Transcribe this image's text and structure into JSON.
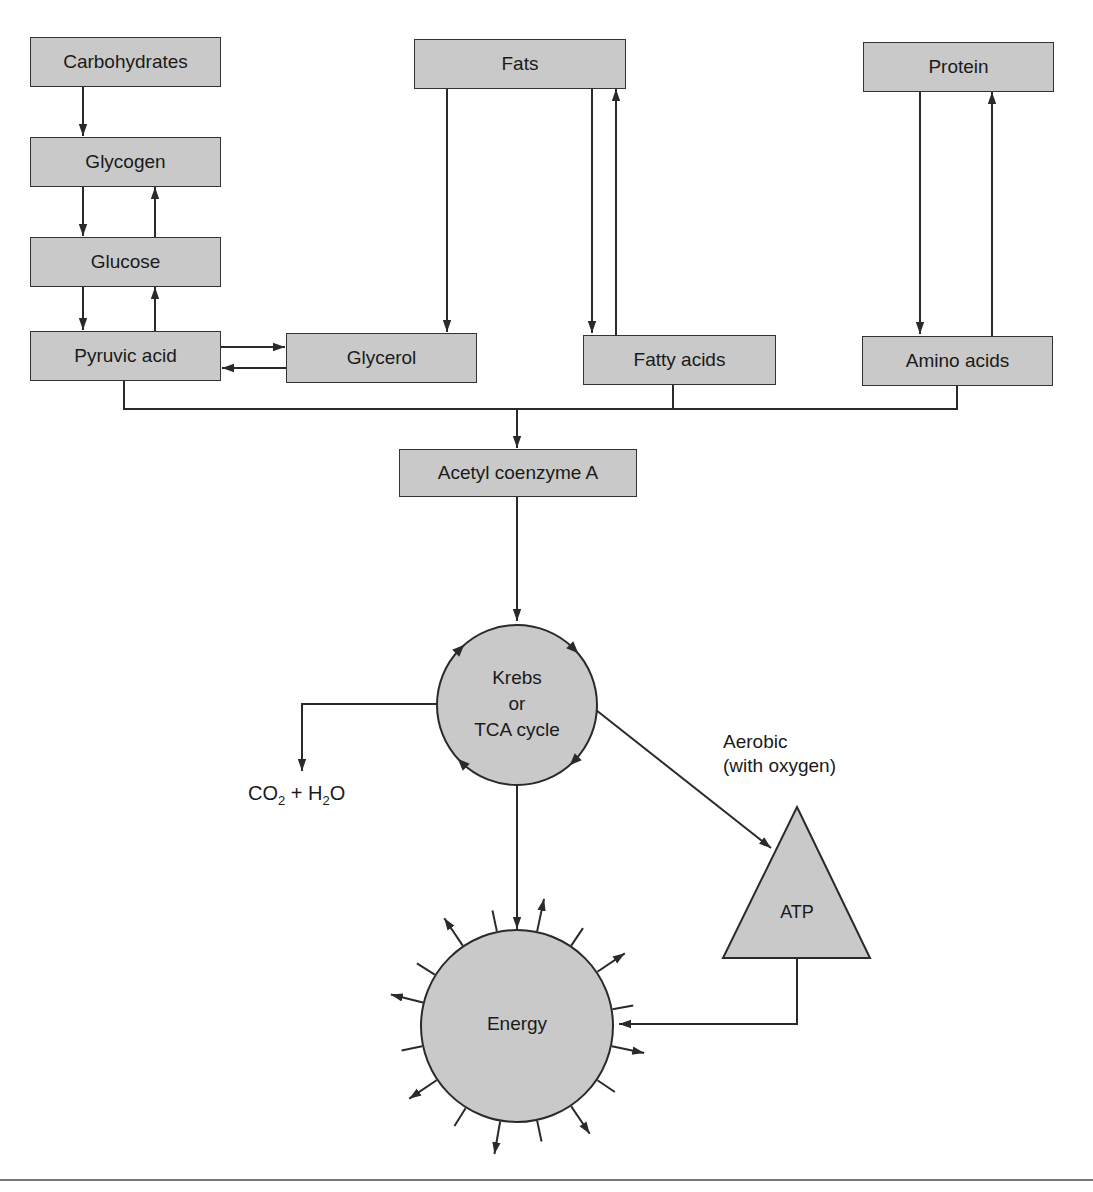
{
  "diagram": {
    "title": "",
    "nodes": {
      "carbohydrates": "Carbohydrates",
      "glycogen": "Glycogen",
      "glucose": "Glucose",
      "pyruvic_acid": "Pyruvic acid",
      "glycerol": "Glycerol",
      "fats": "Fats",
      "fatty_acids": "Fatty acids",
      "protein": "Protein",
      "amino_acids": "Amino acids",
      "acetyl_coa": "Acetyl coenzyme A",
      "krebs_line1": "Krebs",
      "krebs_line2": "or",
      "krebs_line3": "TCA cycle",
      "atp": "ATP",
      "energy": "Energy"
    },
    "labels": {
      "co2_h2o": {
        "co": "CO",
        "sub1": "2",
        "plus": " + H",
        "sub2": "2",
        "o": "O"
      },
      "aerobic_line1": "Aerobic",
      "aerobic_line2": "(with oxygen)"
    },
    "edges": [
      {
        "from": "Carbohydrates",
        "to": "Glycogen"
      },
      {
        "from": "Glycogen",
        "to": "Glucose"
      },
      {
        "from": "Glucose",
        "to": "Glycogen"
      },
      {
        "from": "Glucose",
        "to": "Pyruvic acid"
      },
      {
        "from": "Pyruvic acid",
        "to": "Glucose"
      },
      {
        "from": "Pyruvic acid",
        "to": "Glycerol"
      },
      {
        "from": "Glycerol",
        "to": "Pyruvic acid"
      },
      {
        "from": "Fats",
        "to": "Glycerol"
      },
      {
        "from": "Fats",
        "to": "Fatty acids"
      },
      {
        "from": "Fatty acids",
        "to": "Fats"
      },
      {
        "from": "Protein",
        "to": "Amino acids"
      },
      {
        "from": "Amino acids",
        "to": "Protein"
      },
      {
        "from": "Pyruvic acid",
        "to": "Acetyl coenzyme A"
      },
      {
        "from": "Fatty acids",
        "to": "Acetyl coenzyme A"
      },
      {
        "from": "Amino acids",
        "to": "Acetyl coenzyme A"
      },
      {
        "from": "Acetyl coenzyme A",
        "to": "Krebs or TCA cycle"
      },
      {
        "from": "Krebs or TCA cycle",
        "to": "CO2 + H2O"
      },
      {
        "from": "Krebs or TCA cycle",
        "to": "ATP",
        "label": "Aerobic (with oxygen)"
      },
      {
        "from": "Krebs or TCA cycle",
        "to": "Energy"
      },
      {
        "from": "ATP",
        "to": "Energy"
      }
    ],
    "colors": {
      "fill": "#c9c9c9",
      "stroke": "#2a2a2a",
      "rule": "#777777"
    }
  }
}
